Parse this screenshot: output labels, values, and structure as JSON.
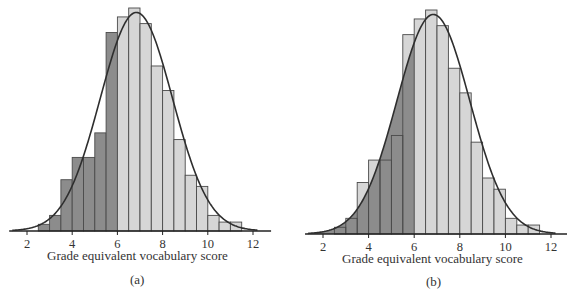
{
  "chart_data": [
    {
      "type": "bar",
      "panel_label": "(a)",
      "title": "",
      "xlabel": "Grade equivalent vocabulary score",
      "ylabel": "",
      "x_ticks": [
        2,
        4,
        6,
        8,
        10,
        12
      ],
      "xlim": [
        1.3,
        12.8
      ],
      "bin_width": 0.5,
      "bins_start": [
        2.5,
        3.0,
        3.5,
        4.0,
        4.5,
        5.0,
        5.5,
        6.0,
        6.5,
        7.0,
        7.5,
        8.0,
        8.5,
        9.0,
        9.5,
        10.0,
        10.5,
        11.0
      ],
      "relative_heights": [
        0.03,
        0.07,
        0.23,
        0.33,
        0.33,
        0.44,
        0.89,
        0.96,
        1.0,
        0.93,
        0.74,
        0.63,
        0.41,
        0.25,
        0.2,
        0.07,
        0.04,
        0.04
      ],
      "normal_curve": {
        "mean": 6.84,
        "sd": 1.6,
        "peak_relative_height": 0.98
      },
      "shading": "bars with score < 6 shaded dark",
      "grid": false,
      "legend": null
    },
    {
      "type": "bar",
      "panel_label": "(b)",
      "title": "",
      "xlabel": "Grade equivalent vocabulary score",
      "ylabel": "",
      "x_ticks": [
        2,
        4,
        6,
        8,
        10,
        12
      ],
      "xlim": [
        1.3,
        12.8
      ],
      "bin_width": 0.5,
      "bins_start": [
        2.5,
        3.0,
        3.5,
        4.0,
        4.5,
        5.0,
        5.5,
        6.0,
        6.5,
        7.0,
        7.5,
        8.0,
        8.5,
        9.0,
        9.5,
        10.0,
        10.5,
        11.0
      ],
      "relative_heights": [
        0.03,
        0.07,
        0.23,
        0.33,
        0.33,
        0.44,
        0.89,
        0.96,
        1.0,
        0.93,
        0.74,
        0.63,
        0.41,
        0.25,
        0.2,
        0.07,
        0.04,
        0.04
      ],
      "normal_curve": {
        "mean": 6.84,
        "sd": 1.6,
        "peak_relative_height": 0.98
      },
      "shading": "area under normal curve for score < 6 shaded dark",
      "grid": false,
      "legend": null
    }
  ],
  "colors": {
    "dark_fill": "#8c8c8c",
    "light_fill": "#d6d6d6",
    "outline": "#4a4a4a",
    "curve": "#2e2e2e",
    "axis": "#222222"
  },
  "panels": {
    "a": {
      "xlabel": "Grade equivalent vocabulary score",
      "label": "(a)"
    },
    "b": {
      "xlabel": "Grade equivalent vocabulary score",
      "label": "(b)"
    }
  }
}
